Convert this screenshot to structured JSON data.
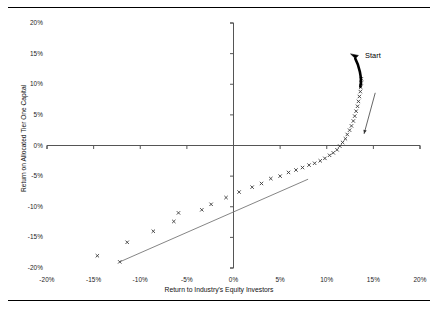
{
  "figure": {
    "has_top_rule": true,
    "has_bottom_rule": true
  },
  "chart_data": {
    "type": "scatter",
    "title": "",
    "xlabel": "Return to Industry's Equity Investors",
    "ylabel": "Return on Allocated Tier One Capital",
    "xlim": [
      -20,
      20
    ],
    "ylim": [
      -20,
      20
    ],
    "xticks": [
      -20,
      -15,
      -10,
      -5,
      0,
      5,
      10,
      15,
      20
    ],
    "yticks": [
      -20,
      -15,
      -10,
      -5,
      0,
      5,
      10,
      15,
      20
    ],
    "xtick_labels": [
      "-20%",
      "-15%",
      "-10%",
      "-5%",
      "0%",
      "5%",
      "10%",
      "15%",
      "20%"
    ],
    "ytick_labels": [
      "-20%",
      "-15%",
      "-10%",
      "-5%",
      "0%",
      "5%",
      "10%",
      "15%",
      "20%"
    ],
    "grid": false,
    "legend": null,
    "marker": "x",
    "marker_color": "#3a3a3a",
    "axis_color": "#555555",
    "series": [
      {
        "name": "Return profile",
        "points": [
          [
            -14.6,
            -18.0
          ],
          [
            -12.2,
            -19.0
          ],
          [
            -11.4,
            -15.8
          ],
          [
            -8.6,
            -14.0
          ],
          [
            -6.4,
            -12.4
          ],
          [
            -5.9,
            -11.0
          ],
          [
            -3.4,
            -10.5
          ],
          [
            -2.4,
            -9.6
          ],
          [
            -0.8,
            -8.5
          ],
          [
            0.6,
            -7.6
          ],
          [
            2.0,
            -6.8
          ],
          [
            3.0,
            -6.2
          ],
          [
            4.0,
            -5.4
          ],
          [
            5.0,
            -5.0
          ],
          [
            5.9,
            -4.4
          ],
          [
            6.7,
            -4.0
          ],
          [
            7.4,
            -3.6
          ],
          [
            8.1,
            -3.2
          ],
          [
            8.7,
            -2.9
          ],
          [
            9.3,
            -2.5
          ],
          [
            9.8,
            -2.1
          ],
          [
            10.3,
            -1.6
          ],
          [
            10.7,
            -1.2
          ],
          [
            11.1,
            -0.7
          ],
          [
            11.4,
            -0.1
          ],
          [
            11.7,
            0.5
          ],
          [
            12.0,
            1.1
          ],
          [
            12.2,
            1.8
          ],
          [
            12.45,
            2.5
          ],
          [
            12.65,
            3.2
          ],
          [
            12.85,
            4.0
          ],
          [
            13.0,
            4.8
          ],
          [
            13.15,
            5.6
          ],
          [
            13.3,
            6.4
          ],
          [
            13.4,
            7.2
          ],
          [
            13.5,
            8.0
          ],
          [
            13.6,
            8.8
          ],
          [
            13.65,
            9.5
          ],
          [
            13.7,
            10.2
          ],
          [
            13.72,
            10.9
          ]
        ]
      }
    ],
    "reference_line": {
      "name": "reference-line",
      "x0": -12.2,
      "y0": -19.0,
      "x1": 8.0,
      "y1": -5.5
    },
    "annotations": [
      {
        "name": "start",
        "text": "Start",
        "x": 15.4,
        "y": 14.6,
        "arrow_style": "thick-curved",
        "arrow_from": [
          13.6,
          9.6
        ],
        "arrow_to": [
          12.9,
          14.6
        ]
      },
      {
        "name": "direction-arrow",
        "text": "",
        "arrow_style": "thin-straight",
        "arrow_from": [
          15.2,
          8.6
        ],
        "arrow_to": [
          14.0,
          1.9
        ]
      }
    ]
  }
}
